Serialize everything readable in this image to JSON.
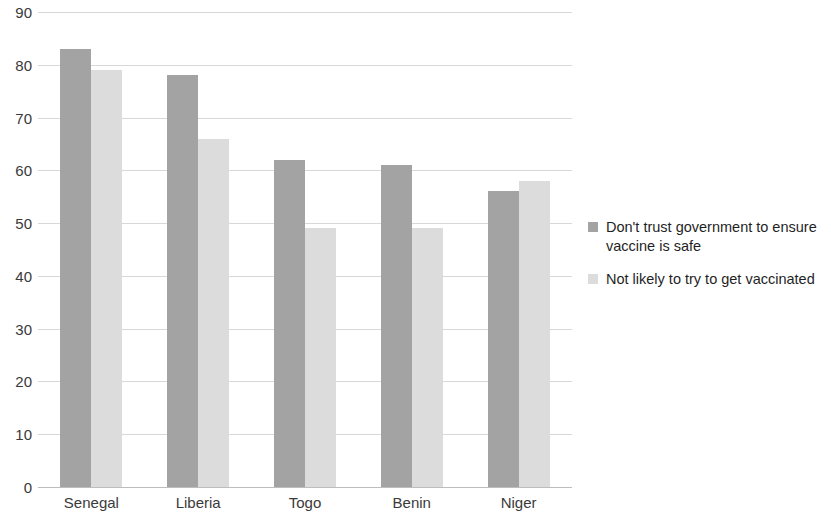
{
  "chart_data": {
    "type": "bar",
    "title": "",
    "subtitle": "",
    "xlabel": "",
    "ylabel": "",
    "ylim": [
      0,
      90
    ],
    "ytick_step": 10,
    "yticks": [
      90,
      80,
      70,
      60,
      50,
      40,
      30,
      20,
      10,
      0
    ],
    "categories": [
      "Senegal",
      "Liberia",
      "Togo",
      "Benin",
      "Niger"
    ],
    "series": [
      {
        "name": "Don't trust government to ensure vaccine is safe",
        "color": "#a3a3a3",
        "values": [
          83,
          78,
          62,
          61,
          56
        ]
      },
      {
        "name": "Not likely to try to get vaccinated",
        "color": "#dcdcdc",
        "values": [
          79,
          66,
          49,
          49,
          58
        ]
      }
    ],
    "grid": true,
    "grid_axis": "y",
    "legend_position": "right",
    "annotations": []
  },
  "legend": {
    "entries": [
      {
        "label": "Don't trust government to ensure vaccine is safe",
        "swatch": "series-0-swatch"
      },
      {
        "label": "Not likely to try to get vaccinated",
        "swatch": "series-1-swatch"
      }
    ]
  },
  "axes": {
    "y": {
      "ticks": [
        "90",
        "80",
        "70",
        "60",
        "50",
        "40",
        "30",
        "20",
        "10",
        "0"
      ]
    },
    "x": {
      "ticks": [
        "Senegal",
        "Liberia",
        "Togo",
        "Benin",
        "Niger"
      ]
    }
  }
}
